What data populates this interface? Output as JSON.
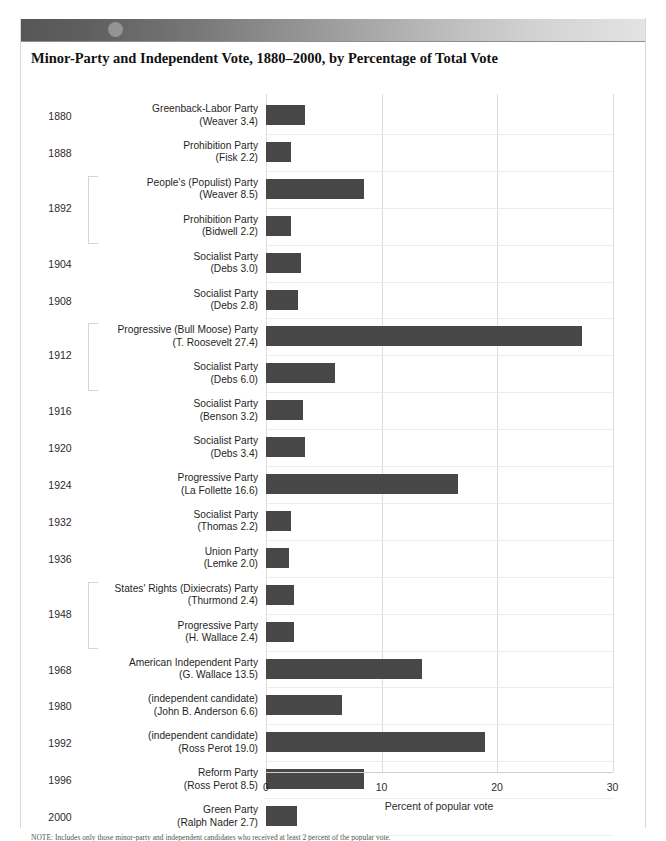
{
  "figure": {
    "label_caps": "F",
    "label_rest": "IGURE",
    "number": "9-1",
    "full_label": "Figure 9-1"
  },
  "chart_title": "Minor-Party and Independent Vote, 1880–2000, by Percentage of Total Vote",
  "note": "NOTE: Includes only those minor-party and independent candidates who received at least 2 percent of the popular vote.",
  "axis": {
    "title": "Percent of popular vote",
    "ticks": [
      "0",
      "10",
      "20",
      "30"
    ]
  },
  "colors": {
    "bar": "#474747",
    "gridline": "#dcdcdc",
    "band_dark": "#575757",
    "band_light": "#e3e3e3"
  },
  "chart_data": {
    "type": "bar",
    "orientation": "horizontal",
    "title": "Minor-Party and Independent Vote, 1880–2000, by Percentage of Total Vote",
    "xlabel": "Percent of popular vote",
    "ylabel": "",
    "xlim": [
      0,
      30
    ],
    "xticks": [
      0,
      10,
      20,
      30
    ],
    "grid": true,
    "legend": null,
    "categories": [
      "1880 Greenback-Labor Party (Weaver)",
      "1888 Prohibition Party (Fisk)",
      "1892 People's (Populist) Party (Weaver)",
      "1892 Prohibition Party (Bidwell)",
      "1904 Socialist Party (Debs)",
      "1908 Socialist Party (Debs)",
      "1912 Progressive (Bull Moose) Party (T. Roosevelt)",
      "1912 Socialist Party (Debs)",
      "1916 Socialist Party (Benson)",
      "1920 Socialist Party (Debs)",
      "1924 Progressive Party (La Follette)",
      "1932 Socialist Party (Thomas)",
      "1936 Union Party (Lemke)",
      "1948 States' Rights (Dixiecrats) Party (Thurmond)",
      "1948 Progressive Party (H. Wallace)",
      "1968 American Independent Party (G. Wallace)",
      "1980 (independent candidate) (John B. Anderson)",
      "1992 (independent candidate) (Ross Perot)",
      "1996 Reform Party (Ross Perot)",
      "2000 Green Party (Ralph Nader)"
    ],
    "values": [
      3.4,
      2.2,
      8.5,
      2.2,
      3.0,
      2.8,
      27.4,
      6.0,
      3.2,
      3.4,
      16.6,
      2.2,
      2.0,
      2.4,
      2.4,
      13.5,
      6.6,
      19.0,
      8.5,
      2.7
    ]
  },
  "rows": [
    {
      "year": "1880",
      "show_year": true,
      "party": "Greenback-Labor Party",
      "candidate": "(Weaver 3.4)",
      "value": 3.4,
      "group": null
    },
    {
      "year": "1888",
      "show_year": true,
      "party": "Prohibition Party",
      "candidate": "(Fisk 2.2)",
      "value": 2.2,
      "group": null
    },
    {
      "year": "1892",
      "show_year": false,
      "party": "People's (Populist) Party",
      "candidate": "(Weaver 8.5)",
      "value": 8.5,
      "group": "g1892"
    },
    {
      "year": "1892",
      "show_year": false,
      "party": "Prohibition Party",
      "candidate": "(Bidwell 2.2)",
      "value": 2.2,
      "group": "g1892"
    },
    {
      "year": "1904",
      "show_year": true,
      "party": "Socialist Party",
      "candidate": "(Debs 3.0)",
      "value": 3.0,
      "group": null
    },
    {
      "year": "1908",
      "show_year": true,
      "party": "Socialist Party",
      "candidate": "(Debs 2.8)",
      "value": 2.8,
      "group": null
    },
    {
      "year": "1912",
      "show_year": false,
      "party": "Progressive (Bull Moose) Party",
      "candidate": "(T. Roosevelt 27.4)",
      "value": 27.4,
      "group": "g1912"
    },
    {
      "year": "1912",
      "show_year": false,
      "party": "Socialist Party",
      "candidate": "(Debs 6.0)",
      "value": 6.0,
      "group": "g1912"
    },
    {
      "year": "1916",
      "show_year": true,
      "party": "Socialist Party",
      "candidate": "(Benson 3.2)",
      "value": 3.2,
      "group": null
    },
    {
      "year": "1920",
      "show_year": true,
      "party": "Socialist Party",
      "candidate": "(Debs 3.4)",
      "value": 3.4,
      "group": null
    },
    {
      "year": "1924",
      "show_year": true,
      "party": "Progressive Party",
      "candidate": "(La Follette 16.6)",
      "value": 16.6,
      "group": null
    },
    {
      "year": "1932",
      "show_year": true,
      "party": "Socialist Party",
      "candidate": "(Thomas 2.2)",
      "value": 2.2,
      "group": null
    },
    {
      "year": "1936",
      "show_year": true,
      "party": "Union Party",
      "candidate": "(Lemke 2.0)",
      "value": 2.0,
      "group": null
    },
    {
      "year": "1948",
      "show_year": false,
      "party": "States' Rights (Dixiecrats) Party",
      "candidate": "(Thurmond 2.4)",
      "value": 2.4,
      "group": "g1948"
    },
    {
      "year": "1948",
      "show_year": false,
      "party": "Progressive Party",
      "candidate": "(H. Wallace 2.4)",
      "value": 2.4,
      "group": "g1948"
    },
    {
      "year": "1968",
      "show_year": true,
      "party": "American Independent Party",
      "candidate": "(G. Wallace 13.5)",
      "value": 13.5,
      "group": null
    },
    {
      "year": "1980",
      "show_year": true,
      "party": "(independent candidate)",
      "candidate": "(John B. Anderson 6.6)",
      "value": 6.6,
      "group": null
    },
    {
      "year": "1992",
      "show_year": true,
      "party": "(independent candidate)",
      "candidate": "(Ross Perot 19.0)",
      "value": 19.0,
      "group": null
    },
    {
      "year": "1996",
      "show_year": true,
      "party": "Reform Party",
      "candidate": "(Ross Perot 8.5)",
      "value": 8.5,
      "group": null
    },
    {
      "year": "2000",
      "show_year": true,
      "party": "Green Party",
      "candidate": "(Ralph Nader 2.7)",
      "value": 2.7,
      "group": null
    }
  ],
  "groups": [
    {
      "id": "g1892",
      "year": "1892",
      "first": 2,
      "last": 3
    },
    {
      "id": "g1912",
      "year": "1912",
      "first": 6,
      "last": 7
    },
    {
      "id": "g1948",
      "year": "1948",
      "first": 13,
      "last": 14
    }
  ]
}
